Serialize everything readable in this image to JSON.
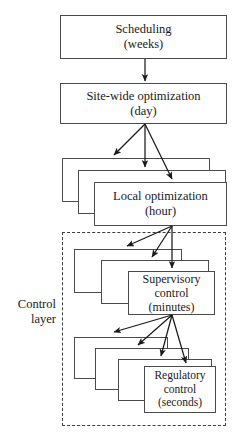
{
  "diagram": {
    "colors": {
      "box_border": "#4a4a4a",
      "dashed_border": "#3c3c3c",
      "arrow": "#1a1a1a",
      "background": "#ffffff",
      "text": "#1a1a1a"
    },
    "levels": [
      {
        "id": "scheduling",
        "line1": "Scheduling",
        "line2": "(weeks)",
        "line3": "",
        "stack_count": 1,
        "font_size": 12.5
      },
      {
        "id": "site-wide-optimization",
        "line1": "Site-wide optimization",
        "line2": "(day)",
        "line3": "",
        "stack_count": 1,
        "font_size": 12.5
      },
      {
        "id": "local-optimization",
        "line1": "Local optimization",
        "line2": "(hour)",
        "line3": "",
        "stack_count": 3,
        "font_size": 12.5
      },
      {
        "id": "supervisory-control",
        "line1": "Supervisory",
        "line2": "control",
        "line3": "(minutes)",
        "stack_count": 3,
        "font_size": 12
      },
      {
        "id": "regulatory-control",
        "line1": "Regulatory",
        "line2": "control",
        "line3": "(seconds)",
        "stack_count": 4,
        "font_size": 11.5
      }
    ],
    "region": {
      "id": "control-layer",
      "label_line1": "Control",
      "label_line2": "layer"
    }
  }
}
